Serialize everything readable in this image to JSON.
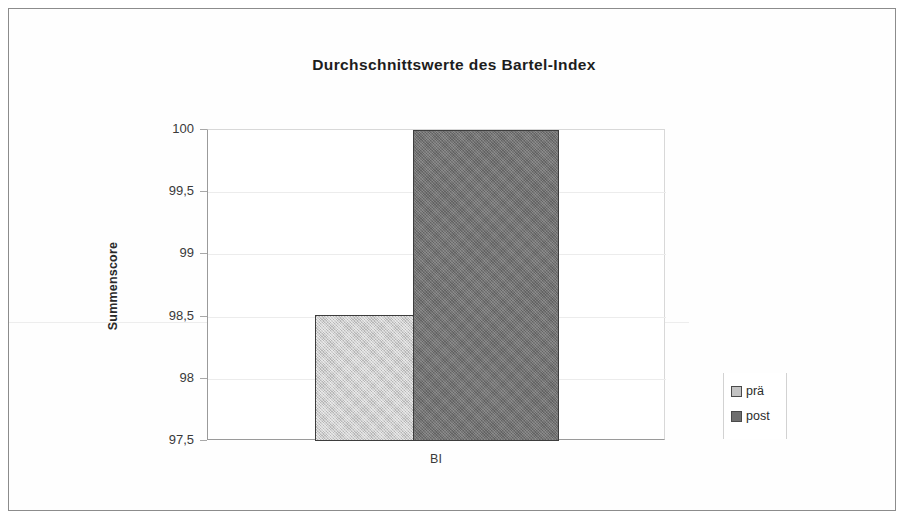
{
  "chart_data": {
    "type": "bar",
    "title": "Durchschnittswerte des Bartel-Index",
    "xlabel": "",
    "ylabel": "Summenscore",
    "categories": [
      "BI"
    ],
    "series": [
      {
        "name": "prä",
        "values": [
          98.51
        ],
        "color": "#c3c3c3"
      },
      {
        "name": "post",
        "values": [
          100.0
        ],
        "color": "#6f6f6f"
      }
    ],
    "ylim": [
      97.5,
      100
    ],
    "ytick_labels": [
      "100",
      "99,5",
      "99",
      "98,5",
      "98",
      "97,5"
    ],
    "ytick_values": [
      100,
      99.5,
      99,
      98.5,
      98,
      97.5
    ],
    "grid": true,
    "legend_position": "right"
  },
  "title": {
    "text": "Durchschnittswerte des Bartel-Index"
  },
  "axes": {
    "y_title": "Summenscore",
    "y_ticks": [
      {
        "label": "100",
        "value": 100
      },
      {
        "label": "99,5",
        "value": 99.5
      },
      {
        "label": "99",
        "value": 99
      },
      {
        "label": "98,5",
        "value": 98.5
      },
      {
        "label": "98",
        "value": 98
      },
      {
        "label": "97,5",
        "value": 97.5
      }
    ],
    "x_category": "BI"
  },
  "bars": [
    {
      "name": "prä",
      "value": 98.51,
      "color": "#c3c3c3"
    },
    {
      "name": "post",
      "value": 100.0,
      "color": "#6f6f6f"
    }
  ],
  "legend": {
    "items": [
      {
        "label": "prä",
        "color": "#c3c3c3"
      },
      {
        "label": "post",
        "color": "#6f6f6f"
      }
    ]
  }
}
